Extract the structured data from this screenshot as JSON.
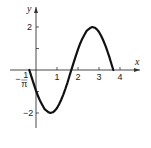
{
  "chart_data": {
    "type": "line",
    "title": "",
    "xlabel": "x",
    "ylabel": "y",
    "xlim": [
      -0.6,
      4.8
    ],
    "ylim": [
      -2.6,
      2.9
    ],
    "x_ticks": [
      {
        "value": 1,
        "label": "1"
      },
      {
        "value": 2,
        "label": "2"
      },
      {
        "value": 3,
        "label": "3"
      },
      {
        "value": 4,
        "label": "4"
      }
    ],
    "x_special_label": {
      "value": -0.3183,
      "label_num": "1",
      "label_den": "π",
      "sign": "−"
    },
    "y_ticks": [
      {
        "value": 2,
        "label": "2"
      },
      {
        "value": 1,
        "label": ""
      },
      {
        "value": -1,
        "label": ""
      },
      {
        "value": -2,
        "label": "−2"
      }
    ],
    "grid": false,
    "series": [
      {
        "name": "y = -2 sin(πx/2 + 1/2)",
        "x": [
          -0.318,
          -0.2,
          -0.1,
          0.0,
          0.1,
          0.2,
          0.3,
          0.4,
          0.5,
          0.6,
          0.682,
          0.8,
          0.9,
          1.0,
          1.1,
          1.2,
          1.3,
          1.4,
          1.5,
          1.6,
          1.682,
          1.8,
          1.9,
          2.0,
          2.1,
          2.2,
          2.3,
          2.4,
          2.5,
          2.6,
          2.682,
          2.8,
          2.9,
          3.0,
          3.1,
          3.2,
          3.3,
          3.4,
          3.5,
          3.6,
          3.682
        ],
        "y": [
          0.0,
          -0.369,
          -0.669,
          -0.959,
          -1.222,
          -1.446,
          -1.626,
          -1.806,
          -1.893,
          -1.967,
          -2.0,
          -1.966,
          -1.888,
          -1.768,
          -1.596,
          -1.385,
          -1.142,
          -0.873,
          -0.583,
          -0.256,
          0.0,
          0.369,
          0.669,
          0.959,
          1.222,
          1.446,
          1.626,
          1.806,
          1.893,
          1.967,
          2.0,
          1.966,
          1.888,
          1.768,
          1.596,
          1.385,
          1.142,
          0.873,
          0.583,
          0.256,
          0.0
        ]
      }
    ]
  }
}
